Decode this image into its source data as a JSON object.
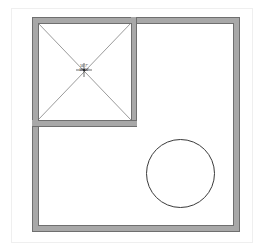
{
  "drawing": {
    "title": "Floor plan",
    "background_color": "#ffffff",
    "frame": {
      "name": "page-frame",
      "color": "#efefef",
      "x": 11,
      "y": 8,
      "width": 242,
      "height": 235
    },
    "walls": {
      "color_fill": "#a8a8a8",
      "color_line": "#7a7a7a",
      "thickness": 6,
      "outer_room": {
        "label": "outer-wall-rectangle",
        "x": 32,
        "y": 17,
        "width": 208,
        "height": 215
      },
      "inner_room": {
        "label": "inner-room-rectangle",
        "x": 32,
        "y": 17,
        "width": 105,
        "height": 109
      }
    },
    "diagonals": {
      "label": "hip-roof-diagonals",
      "color": "#6e6e6e",
      "lines": [
        {
          "x1": 38,
          "y1": 23,
          "x2": 131,
          "y2": 120
        },
        {
          "x1": 131,
          "y1": 23,
          "x2": 38,
          "y2": 120
        }
      ]
    },
    "center_marker": {
      "label": "dimension-marker",
      "x": 84,
      "y": 70,
      "color": "#2b2b2b"
    },
    "dimension_text": {
      "line1": "16' 7\"",
      "line2": "18' 10\"",
      "x": 84,
      "y": 69
    },
    "circle": {
      "label": "circular-feature",
      "cx": 180.5,
      "cy": 173.5,
      "r": 34,
      "stroke": "#3a3a3a",
      "stroke_width": 1,
      "fill": "none"
    }
  }
}
